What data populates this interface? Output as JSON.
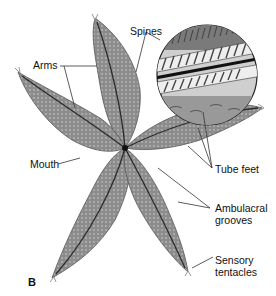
{
  "figure": {
    "panel_label": "B",
    "labels": {
      "arms": "Arms",
      "spines": "Spines",
      "mouth": "Mouth",
      "tube_feet": "Tube feet",
      "ambulacral_grooves_line1": "Ambulacral",
      "ambulacral_grooves_line2": "grooves",
      "sensory_tentacles_line1": "Sensory",
      "sensory_tentacles_line2": "tentacles"
    },
    "colors": {
      "body": "#8a8a8a",
      "body_dark": "#5a5a5a",
      "groove": "#2a2a2a",
      "leader_line": "#333333"
    }
  }
}
